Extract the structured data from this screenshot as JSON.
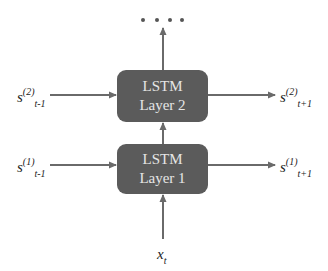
{
  "diagram": {
    "colors": {
      "box_fill": "#5b5b5b",
      "box_text": "#e6e6e6",
      "arrow": "#6a6a6a",
      "label": "#222222"
    },
    "layers": [
      {
        "id": "layer1",
        "line1": "LSTM",
        "line2": "Layer 1"
      },
      {
        "id": "layer2",
        "line1": "LSTM",
        "line2": "Layer 2"
      }
    ],
    "labels": {
      "layer2_in": {
        "base": "s",
        "sup": "(2)",
        "sub": "t-1"
      },
      "layer2_out": {
        "base": "s",
        "sup": "(2)",
        "sub": "t+1"
      },
      "layer1_in": {
        "base": "s",
        "sup": "(1)",
        "sub": "t-1"
      },
      "layer1_out": {
        "base": "s",
        "sup": "(1)",
        "sub": "t+1"
      },
      "input": {
        "base": "x",
        "sub": "t"
      }
    },
    "continuation": {
      "symbol": "• • • •",
      "count": 4
    }
  }
}
